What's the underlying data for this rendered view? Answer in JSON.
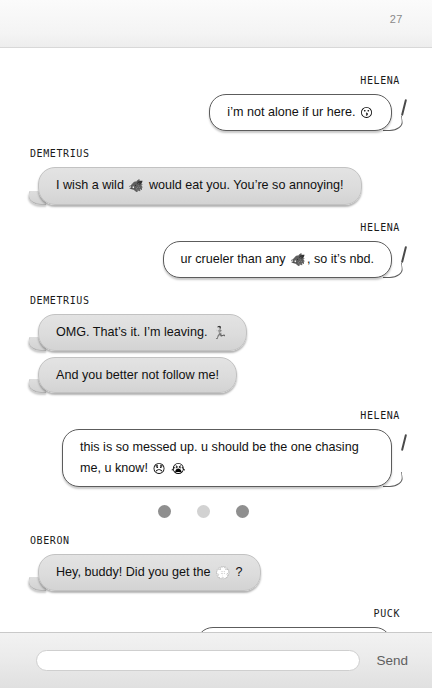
{
  "page": {
    "number": "27"
  },
  "colors": {
    "bubble_left_bg": "#dcdcdc",
    "bubble_right_bg": "#ffffff",
    "bubble_right_border": "#5c5c5c",
    "text": "#111111",
    "page_number": "#8a8a8a",
    "typing_dot_dark": "#8f8f8f",
    "typing_dot_light": "#d2d2d2",
    "composer_bg": "#e9e9e9",
    "send_label": "#5f5f5f"
  },
  "conversation": {
    "groups": [
      {
        "speaker": "Helena",
        "side": "right",
        "messages": [
          {
            "parts": [
              {
                "type": "text",
                "value": "i’m not alone if ur here. "
              },
              {
                "type": "emoji",
                "name": "kissing-face-emoji",
                "glyph": "😗"
              }
            ]
          }
        ]
      },
      {
        "speaker": "Demetrius",
        "side": "left",
        "messages": [
          {
            "parts": [
              {
                "type": "text",
                "value": "I wish a wild "
              },
              {
                "type": "emoji",
                "name": "boar-emoji",
                "glyph": "🐗"
              },
              {
                "type": "text",
                "value": " would eat you. You’re so annoying!"
              }
            ]
          }
        ]
      },
      {
        "speaker": "Helena",
        "side": "right",
        "messages": [
          {
            "parts": [
              {
                "type": "text",
                "value": "ur crueler than any "
              },
              {
                "type": "emoji",
                "name": "boar-emoji",
                "glyph": "🐗"
              },
              {
                "type": "text",
                "value": ", so it’s nbd."
              }
            ]
          }
        ]
      },
      {
        "speaker": "Demetrius",
        "side": "left",
        "messages": [
          {
            "parts": [
              {
                "type": "text",
                "value": "OMG. That’s it. I’m leaving. "
              },
              {
                "type": "emoji",
                "name": "running-person-emoji",
                "glyph": "🏃"
              }
            ]
          },
          {
            "parts": [
              {
                "type": "text",
                "value": "And you better not follow me!"
              }
            ]
          }
        ]
      },
      {
        "speaker": "Helena",
        "side": "right",
        "messages": [
          {
            "parts": [
              {
                "type": "text",
                "value": "this is so messed up. u should be the one chasing me, u know! "
              },
              {
                "type": "emoji",
                "name": "disappointed-face-emoji",
                "glyph": "😞"
              },
              {
                "type": "text",
                "value": " "
              },
              {
                "type": "emoji",
                "name": "loudly-crying-face-emoji",
                "glyph": "😭"
              }
            ]
          }
        ]
      },
      {
        "type": "typing-indicator",
        "dots": [
          "#8f8f8f",
          "#d2d2d2",
          "#8f8f8f"
        ]
      },
      {
        "speaker": "Oberon",
        "side": "left",
        "messages": [
          {
            "parts": [
              {
                "type": "text",
                "value": "Hey, buddy! Did you get the "
              },
              {
                "type": "emoji",
                "name": "white-flower-emoji",
                "glyph": "💮"
              },
              {
                "type": "text",
                "value": " ?"
              }
            ]
          }
        ]
      },
      {
        "speaker": "Puck",
        "side": "right",
        "messages": [
          {
            "parts": [
              {
                "type": "text",
                "value": "Yep! I’ll bring it over in a sec."
              }
            ]
          }
        ]
      }
    ]
  },
  "composer": {
    "input_value": "",
    "input_placeholder": "",
    "send_label": "Send"
  }
}
